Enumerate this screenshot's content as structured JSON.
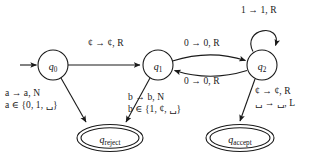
{
  "diagram": {
    "type": "turing-machine-state-diagram",
    "background_color": "#ffffff",
    "line_color": "#1a1a1a",
    "states": [
      {
        "id": "q0",
        "name": "q",
        "sub": "0",
        "cx": 53,
        "cy": 65,
        "r": 15,
        "shape": "circle",
        "start": true
      },
      {
        "id": "q1",
        "name": "q",
        "sub": "1",
        "cx": 158,
        "cy": 65,
        "r": 15,
        "shape": "circle",
        "start": false
      },
      {
        "id": "q2",
        "name": "q",
        "sub": "2",
        "cx": 262,
        "cy": 65,
        "r": 15,
        "shape": "circle",
        "start": false
      },
      {
        "id": "qreject",
        "name": "q",
        "sub": "reject",
        "cx": 110,
        "cy": 138,
        "rx": 32,
        "ry": 13,
        "shape": "double-ellipse",
        "start": false
      },
      {
        "id": "qaccept",
        "name": "q",
        "sub": "accept",
        "cx": 240,
        "cy": 138,
        "rx": 33,
        "ry": 13,
        "shape": "double-ellipse",
        "start": false
      }
    ],
    "transitions": [
      {
        "id": "t-q0-q1",
        "from": "q0",
        "to": "q1",
        "label": "¢ → ¢, R"
      },
      {
        "id": "t-q1-q2-top",
        "from": "q1",
        "to": "q2",
        "label": "0 → 0, R"
      },
      {
        "id": "t-q2-q1-bottom",
        "from": "q2",
        "to": "q1",
        "label": "0 → 0, R"
      },
      {
        "id": "t-q2-self",
        "from": "q2",
        "to": "q2",
        "label": "1 → 1, R"
      },
      {
        "id": "t-q0-qreject",
        "from": "q0",
        "to": "qreject",
        "label_line1": "a → a, N",
        "label_line2": "a ∈ {0, 1, ␣}"
      },
      {
        "id": "t-q1-qreject",
        "from": "q1",
        "to": "qreject",
        "label_line1": "b → b, N",
        "label_line2": "b ∈ {1, ¢, ␣}"
      },
      {
        "id": "t-q2-qaccept",
        "from": "q2",
        "to": "qaccept",
        "label_line1": "¢ → ¢, R",
        "label_line2": "␣ → ␣, L"
      }
    ],
    "labels": {
      "q0_q1": {
        "sym_in": "¢",
        "arrow": "→",
        "sym_out": "¢",
        "move": "R",
        "text": "¢ → ¢, R",
        "x": 88,
        "y": 40
      },
      "q1_q2_top": {
        "text": "0 → 0, R",
        "x": 184,
        "y": 40
      },
      "q2_q1_bottom": {
        "text": "0 → 0, R",
        "x": 184,
        "y": 76
      },
      "q2_self": {
        "text": "1 → 1, R",
        "x": 243,
        "y": 6
      },
      "q0_reject_l1": {
        "text": "a → a, N",
        "x": 6,
        "y": 91
      },
      "q0_reject_l2": {
        "text": "a ∈ {0, 1, ␣}",
        "x": 6,
        "y": 103
      },
      "q1_reject_l1": {
        "text": "b → b, N",
        "x": 128,
        "y": 94
      },
      "q1_reject_l2": {
        "text": "b ∈ {1, ¢, ␣}",
        "x": 128,
        "y": 106
      },
      "q2_accept_l1": {
        "text": "¢ → ¢, R",
        "x": 254,
        "y": 88
      },
      "q2_accept_l2": {
        "text": "␣ → ␣, L",
        "x": 254,
        "y": 100
      }
    }
  }
}
